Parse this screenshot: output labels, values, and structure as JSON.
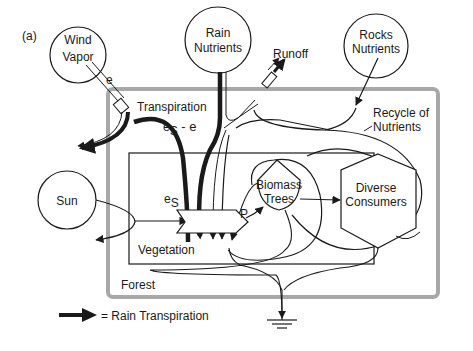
{
  "figure": {
    "panel_label": "(a)",
    "sources": {
      "wind_vapor": [
        "Wind",
        "Vapor"
      ],
      "rain_nutrients": [
        "Rain",
        "Nutrients"
      ],
      "rocks_nutrients": [
        "Rocks",
        "Nutrients"
      ],
      "sun": "Sun"
    },
    "flows": {
      "e": "e",
      "transpiration": "Transpiration",
      "es_minus_e_base": "e",
      "es_minus_e_sub": "S",
      "es_minus_e_rest": " - e",
      "es_base": "e",
      "es_sub": "S",
      "runoff": "Runoff",
      "recycle": [
        "Recycle of",
        "Nutrients"
      ],
      "p": "P"
    },
    "storages": {
      "biomass_trees": [
        "Biomass",
        "Trees"
      ],
      "diverse_consumers": [
        "Diverse",
        "Consumers"
      ]
    },
    "boundaries": {
      "vegetation": "Vegetation",
      "forest": "Forest"
    },
    "legend": {
      "text": "= Rain Transpiration"
    },
    "colors": {
      "line": "#1a1a1a",
      "forest_border": "#a8a8a8",
      "background": "#ffffff"
    }
  }
}
